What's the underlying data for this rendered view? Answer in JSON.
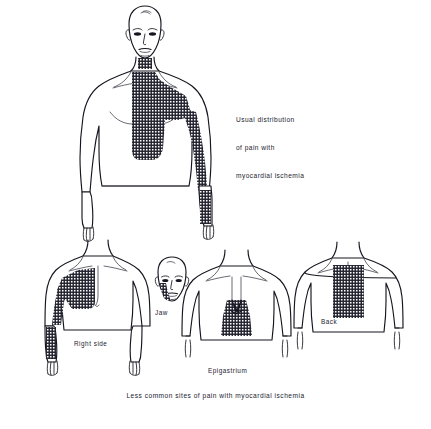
{
  "plate": {
    "title_caption": {
      "line1": "Usual distribution",
      "line2": "of pain with",
      "line3": "myocardial ischemia"
    },
    "bottom_caption": "Less common sites of pain with myocardial ischemia",
    "figures": {
      "main": {
        "name": "anterior-full-figure",
        "label": "",
        "pain_sites": "retrosternal chest, throat, left arm to fingers"
      },
      "right_side": {
        "label": "Right side",
        "pain_sites": "right anterior chest and right arm"
      },
      "jaw": {
        "label": "Jaw",
        "pain_sites": "left jaw and mandible"
      },
      "epigastrium": {
        "label": "Epigastrium",
        "pain_sites": "lower sternum and epigastric region"
      },
      "back": {
        "label": "Back",
        "pain_sites": "interscapular region"
      }
    },
    "colors": {
      "ink": "#15151f",
      "background": "#ffffff",
      "shading": "#2b2b38"
    },
    "shading_style": "cross-hatch grid"
  }
}
